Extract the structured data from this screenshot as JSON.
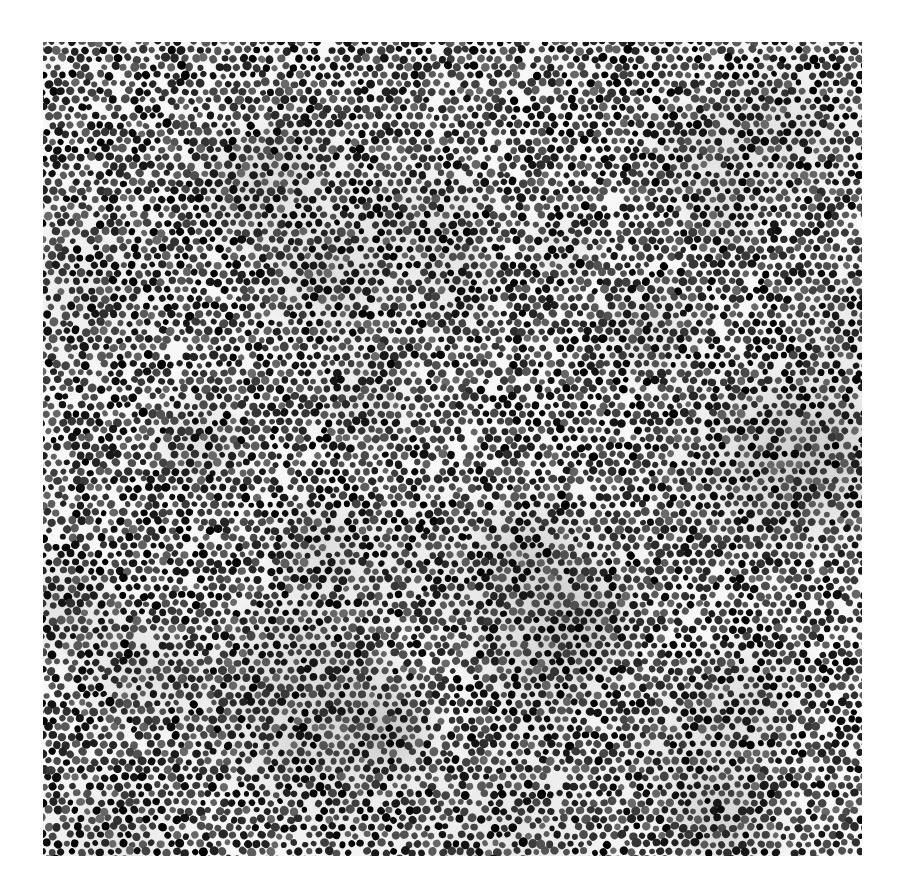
{
  "figure": {
    "background_color": "#ffffff",
    "particle_dark": "#1a1a1a",
    "particle_mid": "#5a5a5a",
    "gap_color": "#e8e8e8",
    "particle_spacing_px": 9.5,
    "particle_radius_px": 3.8
  },
  "caption": {
    "text": ""
  }
}
